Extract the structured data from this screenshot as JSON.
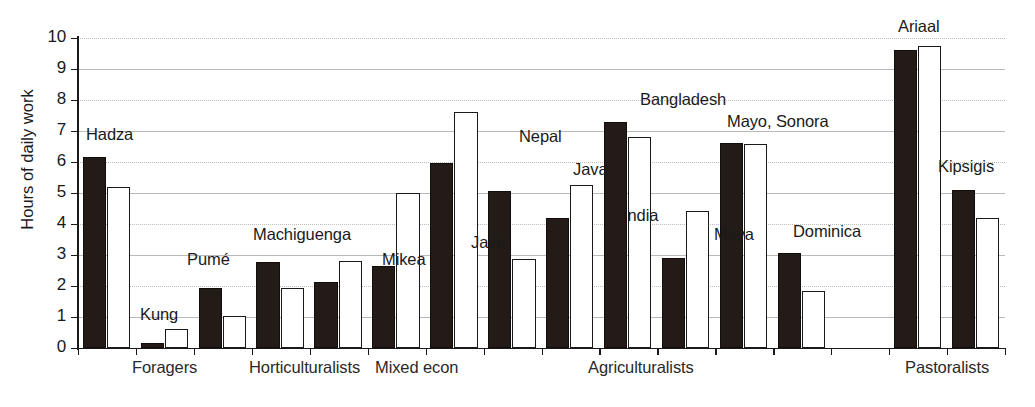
{
  "chart_data": {
    "type": "bar",
    "title": "",
    "xlabel": "",
    "ylabel": "Hours of daily work",
    "ylim": [
      0,
      10
    ],
    "ytick_labels": [
      "0",
      "1",
      "2",
      "3",
      "4",
      "5",
      "6",
      "7",
      "8",
      "9",
      "10"
    ],
    "grid": true,
    "legend": "none",
    "series": [
      {
        "name": "men",
        "color": "#231b17",
        "style": "filled"
      },
      {
        "name": "women",
        "color": "#ffffff",
        "style": "outlined"
      }
    ],
    "categories": [
      "Foragers",
      "Horticulturalists",
      "Mixed econ",
      "Agriculturalists",
      "Pastoralists"
    ],
    "groups": [
      {
        "label": "Hadza",
        "category": "Foragers",
        "slot": 0,
        "values": [
          6.15,
          5.2
        ]
      },
      {
        "label": "Kung",
        "category": "Foragers",
        "slot": 1,
        "values": [
          0.15,
          0.62
        ]
      },
      {
        "label": "Pumé",
        "category": "Foragers",
        "slot": 2,
        "values": [
          1.92,
          1.02
        ]
      },
      {
        "label": "Machiguenga",
        "category": "Horticulturalists",
        "slot": 3,
        "values": [
          2.78,
          1.95
        ]
      },
      {
        "label": "Mikea",
        "category": "Mixed econ",
        "slot": 4,
        "values": [
          2.12,
          2.8
        ]
      },
      {
        "label": "Java",
        "category": "Agriculturalists",
        "slot": 5,
        "values": [
          2.66,
          5.0
        ]
      },
      {
        "label": "Nepal",
        "category": "Agriculturalists",
        "slot": 6,
        "values": [
          5.96,
          7.6
        ]
      },
      {
        "label": "Java",
        "category": "Agriculturalists",
        "slot": 7,
        "values": [
          5.05,
          2.88
        ]
      },
      {
        "label": "India",
        "category": "Agriculturalists",
        "slot": 8,
        "values": [
          4.18,
          5.25
        ]
      },
      {
        "label": "Bangladesh",
        "category": "Agriculturalists",
        "slot": 9,
        "values": [
          7.3,
          6.8
        ]
      },
      {
        "label": "Maya",
        "category": "Agriculturalists",
        "slot": 10,
        "values": [
          2.9,
          4.42
        ]
      },
      {
        "label": "Mayo, Sonora",
        "category": "Agriculturalists",
        "slot": 11,
        "values": [
          6.6,
          6.58
        ]
      },
      {
        "label": "Dominica",
        "category": "Agriculturalists",
        "slot": 12,
        "values": [
          3.05,
          1.85
        ]
      },
      {
        "label": "Ariaal",
        "category": "Pastoralists",
        "slot": 14,
        "values": [
          9.6,
          9.74
        ]
      },
      {
        "label": "Kipsigis",
        "category": "Pastoralists",
        "slot": 15,
        "values": [
          5.1,
          4.2
        ]
      }
    ]
  },
  "axis": {
    "ytitle": "Hours of daily work"
  },
  "category_labels": [
    {
      "text": "Foragers",
      "x": 132
    },
    {
      "text": "Horticulturalists",
      "x": 249
    },
    {
      "text": "Mixed econ",
      "x": 375
    },
    {
      "text": "Agriculturalists",
      "x": 588
    },
    {
      "text": "Pastoralists",
      "x": 905
    }
  ],
  "series_labels": [
    {
      "text": "Hadza",
      "x": 86,
      "y": 125
    },
    {
      "text": "Kung",
      "x": 140,
      "y": 305
    },
    {
      "text": "Pumé",
      "x": 187,
      "y": 250
    },
    {
      "text": "Machiguenga",
      "x": 253,
      "y": 225
    },
    {
      "text": "Mikea",
      "x": 382,
      "y": 250
    },
    {
      "text": "Java",
      "x": 471,
      "y": 233
    },
    {
      "text": "Nepal",
      "x": 519,
      "y": 127
    },
    {
      "text": "Java",
      "x": 573,
      "y": 160
    },
    {
      "text": "India",
      "x": 623,
      "y": 206
    },
    {
      "text": "Bangladesh",
      "x": 640,
      "y": 90
    },
    {
      "text": "Maya",
      "x": 714,
      "y": 225
    },
    {
      "text": "Mayo, Sonora",
      "x": 727,
      "y": 112
    },
    {
      "text": "Dominica",
      "x": 793,
      "y": 222
    },
    {
      "text": "Ariaal",
      "x": 898,
      "y": 17
    },
    {
      "text": "Kipsigis",
      "x": 938,
      "y": 157
    }
  ]
}
